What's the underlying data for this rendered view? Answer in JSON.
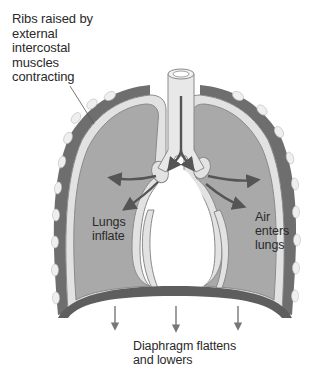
{
  "diagram": {
    "type": "anatomical-illustration",
    "labels": {
      "ribs": "Ribs raised by\nexternal\nintercostal\nmuscles\ncontracting",
      "lungs_inflate": "Lungs\ninflate",
      "air_enters": "Air\nenters\nlungs",
      "diaphragm": "Diaphragm flattens\nand lowers"
    },
    "parts": [
      "trachea",
      "bronchi",
      "left-lung",
      "right-lung",
      "pleura",
      "rib-cage",
      "ribs",
      "diaphragm"
    ],
    "arrows": {
      "airflow": 6,
      "diaphragm_down": 3
    },
    "colors": {
      "lung_fill": "#a9a9a9",
      "pleura": "#e2e2e2",
      "outline": "#8a8a8a",
      "chest_wall": "#6e6e6e",
      "rib": "#efefef",
      "arrow": "#555555",
      "text": "#2a2a2a"
    }
  }
}
